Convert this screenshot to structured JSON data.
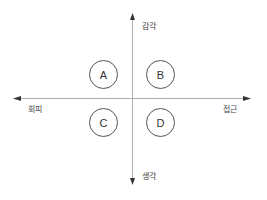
{
  "axes": {
    "top_label": "감각",
    "bottom_label": "생각",
    "left_label": "회피",
    "right_label": "접근"
  },
  "quadrants": [
    {
      "id": "A",
      "label": "A",
      "position": "top-left"
    },
    {
      "id": "B",
      "label": "B",
      "position": "top-right"
    },
    {
      "id": "C",
      "label": "C",
      "position": "bottom-left"
    },
    {
      "id": "D",
      "label": "D",
      "position": "bottom-right"
    }
  ],
  "colors": {
    "axis": "#999999",
    "arrowhead": "#333333",
    "circle_stroke": "#555555",
    "text": "#444444"
  }
}
